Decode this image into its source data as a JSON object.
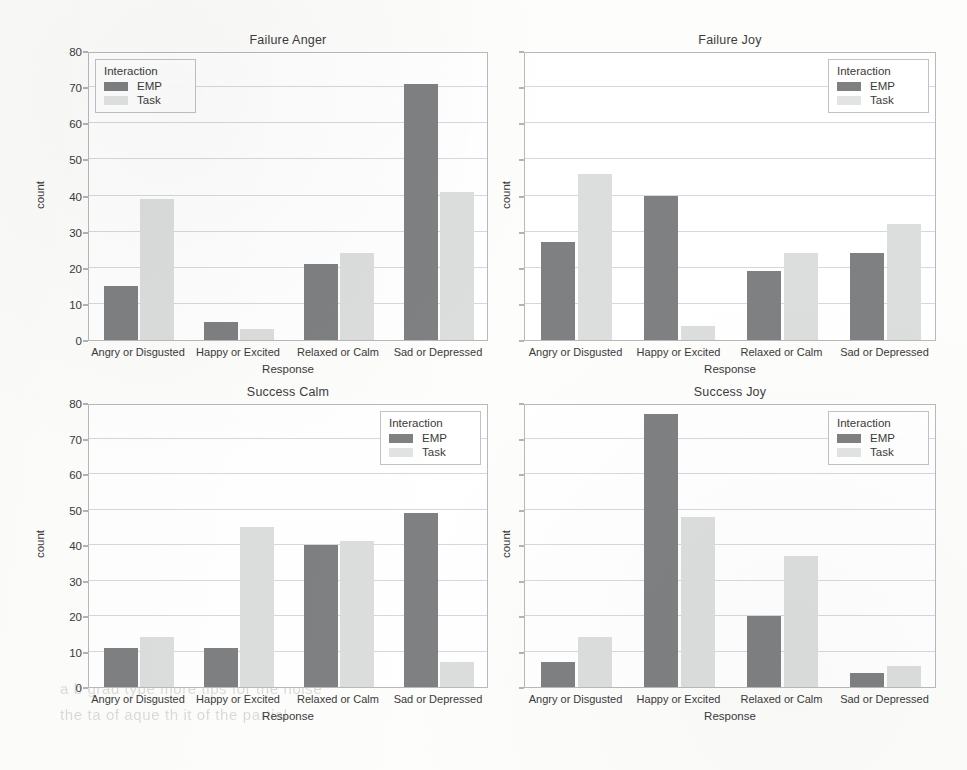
{
  "figure": {
    "legend_title": "Interaction",
    "series_names": [
      "EMP",
      "Task"
    ],
    "colors": {
      "emp": "#7f8082",
      "task": "#dcdddd",
      "grid": "#d5d8dd",
      "frame": "#b9b9bb",
      "text": "#3a3a3a"
    },
    "ghost_lines": [
      "a     b    grad   type   more  tips  for  the  noise",
      "the   ta    of aque   th  it   of   the  partial"
    ]
  },
  "chart_data": [
    {
      "type": "bar",
      "title": "Failure Anger",
      "xlabel": "Response",
      "ylabel": "count",
      "categories": [
        "Angry or Disgusted",
        "Happy or Excited",
        "Relaxed or Calm",
        "Sad or Depressed"
      ],
      "series": [
        {
          "name": "EMP",
          "values": [
            15,
            5,
            21,
            71
          ]
        },
        {
          "name": "Task",
          "values": [
            39,
            3,
            24,
            41
          ]
        }
      ],
      "ylim": [
        0,
        80
      ],
      "yticks": [
        0,
        10,
        20,
        30,
        40,
        50,
        60,
        70,
        80
      ],
      "ytick_labels": [
        "0",
        "10",
        "20",
        "30",
        "40",
        "50",
        "60",
        "70",
        "80"
      ],
      "show_ytick_labels": true,
      "grid": true,
      "legend_position": "upper left"
    },
    {
      "type": "bar",
      "title": "Failure Joy",
      "xlabel": "Response",
      "ylabel": "count",
      "categories": [
        "Angry or Disgusted",
        "Happy or Excited",
        "Relaxed or Calm",
        "Sad or Depressed"
      ],
      "series": [
        {
          "name": "EMP",
          "values": [
            27,
            40,
            19,
            24
          ]
        },
        {
          "name": "Task",
          "values": [
            46,
            4,
            24,
            32
          ]
        }
      ],
      "ylim": [
        0,
        80
      ],
      "yticks": [
        0,
        10,
        20,
        30,
        40,
        50,
        60,
        70,
        80
      ],
      "ytick_labels": [
        "",
        "",
        "",
        "",
        "",
        "",
        "",
        "",
        ""
      ],
      "show_ytick_labels": false,
      "grid": true,
      "legend_position": "upper right"
    },
    {
      "type": "bar",
      "title": "Success Calm",
      "xlabel": "Response",
      "ylabel": "count",
      "categories": [
        "Angry or Disgusted",
        "Happy or Excited",
        "Relaxed or Calm",
        "Sad or Depressed"
      ],
      "series": [
        {
          "name": "EMP",
          "values": [
            11,
            11,
            40,
            49
          ]
        },
        {
          "name": "Task",
          "values": [
            14,
            45,
            41,
            7
          ]
        }
      ],
      "ylim": [
        0,
        80
      ],
      "yticks": [
        0,
        10,
        20,
        30,
        40,
        50,
        60,
        70,
        80
      ],
      "ytick_labels": [
        "0",
        "10",
        "20",
        "30",
        "40",
        "50",
        "60",
        "70",
        "80"
      ],
      "show_ytick_labels": true,
      "grid": true,
      "legend_position": "upper right"
    },
    {
      "type": "bar",
      "title": "Success Joy",
      "xlabel": "Response",
      "ylabel": "count",
      "categories": [
        "Angry or Disgusted",
        "Happy or Excited",
        "Relaxed or Calm",
        "Sad or Depressed"
      ],
      "series": [
        {
          "name": "EMP",
          "values": [
            7,
            77,
            20,
            4
          ]
        },
        {
          "name": "Task",
          "values": [
            14,
            48,
            37,
            6
          ]
        }
      ],
      "ylim": [
        0,
        80
      ],
      "yticks": [
        0,
        10,
        20,
        30,
        40,
        50,
        60,
        70,
        80
      ],
      "ytick_labels": [
        "",
        "",
        "",
        "",
        "",
        "",
        "",
        "",
        ""
      ],
      "show_ytick_labels": false,
      "grid": true,
      "legend_position": "upper right"
    }
  ]
}
